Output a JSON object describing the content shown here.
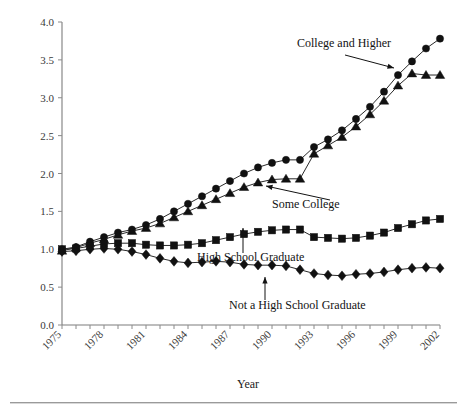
{
  "chart_data": {
    "type": "line",
    "title": "",
    "subtitle": "",
    "xlabel": "Year",
    "ylabel": "",
    "xlim": [
      1975,
      2002
    ],
    "ylim": [
      0.0,
      4.0
    ],
    "grid": false,
    "legend_position": "inline-annotations",
    "x": [
      1975,
      1976,
      1977,
      1978,
      1979,
      1980,
      1981,
      1982,
      1983,
      1984,
      1985,
      1986,
      1987,
      1988,
      1989,
      1990,
      1991,
      1992,
      1993,
      1994,
      1995,
      1996,
      1997,
      1998,
      1999,
      2000,
      2001,
      2002
    ],
    "xticks": [
      1975,
      1978,
      1981,
      1984,
      1987,
      1990,
      1993,
      1996,
      1999,
      2002
    ],
    "xticklabels": [
      "1975",
      "1978",
      "1981",
      "1984",
      "1987",
      "1990",
      "1993",
      "1996",
      "1999",
      "2002"
    ],
    "yticks": [
      0.0,
      0.5,
      1.0,
      1.5,
      2.0,
      2.5,
      3.0,
      3.5,
      4.0
    ],
    "yticklabels": [
      "0.0",
      "0.5",
      "1.0",
      "1.5",
      "2.0",
      "2.5",
      "3.0",
      "3.5",
      "4.0"
    ],
    "series": [
      {
        "name": "College and Higher",
        "marker": "circle",
        "color": "#111111",
        "values": [
          1.0,
          1.03,
          1.1,
          1.16,
          1.22,
          1.26,
          1.32,
          1.4,
          1.5,
          1.6,
          1.7,
          1.8,
          1.9,
          2.0,
          2.08,
          2.14,
          2.18,
          2.18,
          2.35,
          2.45,
          2.57,
          2.72,
          2.88,
          3.08,
          3.3,
          3.48,
          3.65,
          3.78
        ]
      },
      {
        "name": "Some College",
        "marker": "triangle",
        "color": "#111111",
        "values": [
          0.98,
          1.02,
          1.08,
          1.13,
          1.19,
          1.24,
          1.28,
          1.34,
          1.42,
          1.5,
          1.58,
          1.66,
          1.74,
          1.82,
          1.88,
          1.92,
          1.93,
          1.93,
          2.26,
          2.37,
          2.48,
          2.62,
          2.78,
          2.96,
          3.16,
          3.32,
          3.3,
          3.3
        ]
      },
      {
        "name": "High School Graduate",
        "marker": "square",
        "color": "#111111",
        "values": [
          1.0,
          1.01,
          1.04,
          1.07,
          1.08,
          1.08,
          1.06,
          1.05,
          1.05,
          1.06,
          1.08,
          1.12,
          1.16,
          1.2,
          1.23,
          1.25,
          1.26,
          1.26,
          1.16,
          1.15,
          1.14,
          1.15,
          1.18,
          1.22,
          1.28,
          1.33,
          1.38,
          1.4
        ]
      },
      {
        "name": "Not a High School Graduate",
        "marker": "diamond",
        "color": "#111111",
        "values": [
          0.97,
          0.98,
          1.0,
          1.01,
          1.0,
          0.97,
          0.93,
          0.88,
          0.84,
          0.82,
          0.83,
          0.84,
          0.83,
          0.8,
          0.79,
          0.79,
          0.78,
          0.73,
          0.68,
          0.66,
          0.65,
          0.67,
          0.68,
          0.7,
          0.73,
          0.75,
          0.76,
          0.75
        ]
      }
    ],
    "annotations": [
      {
        "text": "College and Higher",
        "series": "College and Higher",
        "target_year": 1999
      },
      {
        "text": "Some College",
        "series": "Some College",
        "target_year": 1989
      },
      {
        "text": "High School Graduate",
        "series": "High School Graduate",
        "target_year": 1990
      },
      {
        "text": "Not a High School Graduate",
        "series": "Not a High School Graduate",
        "target_year": 1989
      }
    ]
  }
}
